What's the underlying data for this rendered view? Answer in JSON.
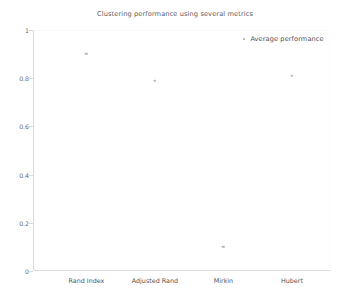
{
  "chart_data": {
    "type": "scatter",
    "title": "Clustering performance using several metrics",
    "xlabel": "",
    "ylabel": "",
    "categories": [
      "Rand Index",
      "Adjusted Rand",
      "Mirkin",
      "Hubert"
    ],
    "series": [
      {
        "name": "Average performance",
        "values": [
          0.9,
          0.79,
          0.1,
          0.81
        ]
      }
    ],
    "ylim": [
      0,
      1
    ],
    "yticks": [
      "0",
      "0.2",
      "0.4",
      "0.6",
      "0.8",
      "1"
    ],
    "ytick_values": [
      0,
      0.2,
      0.4,
      0.6,
      0.8,
      1
    ],
    "grid": false,
    "legend": {
      "position": "top-right",
      "entries": [
        "Average performance"
      ]
    },
    "marker_color": "#b7b7b7",
    "axis_color": "#dcdcdc"
  }
}
